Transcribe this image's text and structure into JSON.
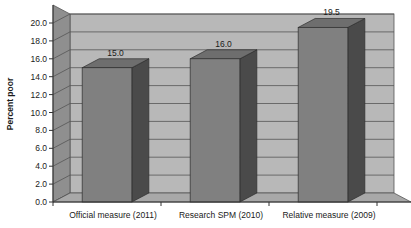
{
  "chart_data": {
    "type": "bar",
    "title": "",
    "subtitle": "",
    "xlabel": "",
    "ylabel": "Percent poor",
    "categories": [
      "Official measure (2011)",
      "Research SPM (2010)",
      "Relative measure (2009)"
    ],
    "values": [
      15.0,
      16.0,
      19.5
    ],
    "data_labels": [
      "15.0",
      "16.0",
      "19.5"
    ],
    "ylim": [
      0.0,
      20.0
    ],
    "ytick_step": 2.0,
    "ytick_labels": [
      "0.0",
      "2.0",
      "4.0",
      "6.0",
      "8.0",
      "10.0",
      "12.0",
      "14.0",
      "16.0",
      "18.0",
      "20.0"
    ],
    "ytick_values": [
      0,
      2,
      4,
      6,
      8,
      10,
      12,
      14,
      16,
      18,
      20
    ],
    "grid": true,
    "grid_axis": "y",
    "legend": false,
    "legend_position": "none",
    "style": "3d-column",
    "colors": {
      "bar_front": "#808080",
      "bar_side": "#4a4a4a",
      "bar_top": "#6e6e6e",
      "plot_background": "#b8b8b8",
      "left_wall": "#8f8f8f",
      "floor": "#a8a8a8",
      "gridline": "#555555",
      "axis_line": "#333333",
      "text": "#1a1a1a",
      "page_background": "#ffffff"
    }
  }
}
